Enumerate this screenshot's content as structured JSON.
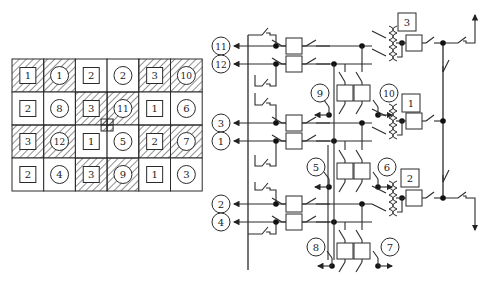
{
  "layout_grid": {
    "rows": 4,
    "cols": 6,
    "cells": [
      [
        {
          "kind": "transformer",
          "label": "1",
          "hatched": true
        },
        {
          "kind": "feeder",
          "label": "1",
          "hatched": true
        },
        {
          "kind": "transformer",
          "label": "2",
          "hatched": false
        },
        {
          "kind": "feeder",
          "label": "2",
          "hatched": false
        },
        {
          "kind": "transformer",
          "label": "3",
          "hatched": true
        },
        {
          "kind": "feeder",
          "label": "10",
          "hatched": true
        }
      ],
      [
        {
          "kind": "transformer",
          "label": "2",
          "hatched": false
        },
        {
          "kind": "feeder",
          "label": "8",
          "hatched": false
        },
        {
          "kind": "transformer",
          "label": "3",
          "hatched": true
        },
        {
          "kind": "feeder",
          "label": "11",
          "hatched": true
        },
        {
          "kind": "transformer",
          "label": "1",
          "hatched": false
        },
        {
          "kind": "feeder",
          "label": "6",
          "hatched": false
        }
      ],
      [
        {
          "kind": "transformer",
          "label": "3",
          "hatched": true
        },
        {
          "kind": "feeder",
          "label": "12",
          "hatched": true
        },
        {
          "kind": "transformer",
          "label": "1",
          "hatched": false
        },
        {
          "kind": "feeder",
          "label": "5",
          "hatched": false
        },
        {
          "kind": "transformer",
          "label": "2",
          "hatched": true
        },
        {
          "kind": "feeder",
          "label": "7",
          "hatched": true
        }
      ],
      [
        {
          "kind": "transformer",
          "label": "2",
          "hatched": false
        },
        {
          "kind": "feeder",
          "label": "4",
          "hatched": false
        },
        {
          "kind": "transformer",
          "label": "3",
          "hatched": true
        },
        {
          "kind": "feeder",
          "label": "9",
          "hatched": true
        },
        {
          "kind": "transformer",
          "label": "1",
          "hatched": false
        },
        {
          "kind": "feeder",
          "label": "3",
          "hatched": false
        }
      ]
    ],
    "center_marker": "hatched-square"
  },
  "schematic": {
    "left_feeders": [
      "11",
      "12",
      "3",
      "1",
      "2",
      "4"
    ],
    "branch_feeders": [
      "9",
      "10",
      "5",
      "6",
      "8",
      "7"
    ],
    "transformers": [
      "3",
      "1",
      "2"
    ]
  }
}
